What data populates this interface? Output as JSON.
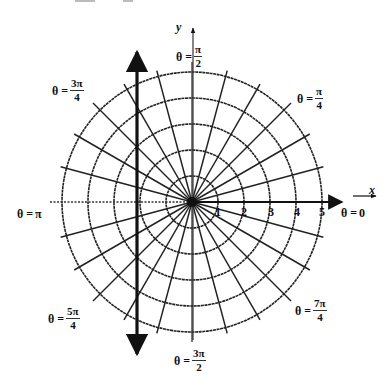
{
  "diagram": {
    "type": "polar-coordinate-grid",
    "center": {
      "x": 192,
      "y": 202
    },
    "ring_spacing_px": 26,
    "rings": [
      1,
      2,
      3,
      4,
      5
    ],
    "radial_line_count": 24,
    "axes": {
      "x_label": "x",
      "y_label": "y",
      "polar_axis_label": "θ = 0"
    },
    "ring_labels": [
      "1",
      "2",
      "3",
      "4",
      "5"
    ],
    "angle_labels": [
      {
        "id": "theta-0",
        "prefix": "θ = ",
        "value": "0",
        "num": "",
        "den": ""
      },
      {
        "id": "theta-pi-4",
        "prefix": "θ = ",
        "value": "",
        "num": "π",
        "den": "4"
      },
      {
        "id": "theta-pi-2",
        "prefix": "θ = ",
        "value": "",
        "num": "π",
        "den": "2"
      },
      {
        "id": "theta-3pi-4",
        "prefix": "θ = ",
        "value": "",
        "num": "3π",
        "den": "4"
      },
      {
        "id": "theta-pi",
        "prefix": "θ = ",
        "value": "π",
        "num": "",
        "den": ""
      },
      {
        "id": "theta-5pi-4",
        "prefix": "θ = ",
        "value": "",
        "num": "5π",
        "den": "4"
      },
      {
        "id": "theta-3pi-2",
        "prefix": "θ = ",
        "value": "",
        "num": "3π",
        "den": "2"
      },
      {
        "id": "theta-7pi-4",
        "prefix": "θ = ",
        "value": "",
        "num": "7π",
        "den": "4"
      }
    ],
    "vertical_line": {
      "x": 137,
      "y_top": 46,
      "y_bottom": 360,
      "arrows": "both"
    },
    "colors": {
      "ink": "#111111",
      "background": "#ffffff",
      "grid": "#222222"
    }
  }
}
